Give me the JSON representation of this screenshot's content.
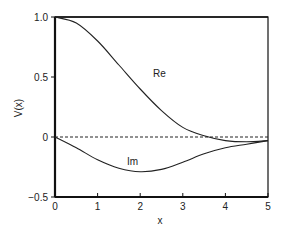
{
  "chart_data": {
    "type": "line",
    "title": "",
    "xlabel": "x",
    "ylabel": "V(x)",
    "xlim": [
      0,
      5
    ],
    "ylim": [
      -0.5,
      1.0
    ],
    "grid": false,
    "legend": "inline labels",
    "x_ticks": [
      "0",
      "1",
      "2",
      "3",
      "4",
      "5"
    ],
    "y_ticks": [
      "-0.5",
      "0",
      "0.5",
      "1.0"
    ],
    "reference_line": {
      "y": 0,
      "style": "dashed"
    },
    "x": [
      0,
      0.5,
      1.0,
      1.5,
      2.0,
      2.5,
      3.0,
      3.5,
      4.0,
      4.5,
      5.0
    ],
    "series": [
      {
        "name": "Re",
        "values": [
          1.0,
          0.95,
          0.8,
          0.6,
          0.4,
          0.22,
          0.08,
          0.01,
          -0.03,
          -0.04,
          -0.03
        ]
      },
      {
        "name": "Im",
        "values": [
          0.0,
          -0.09,
          -0.19,
          -0.26,
          -0.29,
          -0.27,
          -0.21,
          -0.14,
          -0.09,
          -0.06,
          -0.03
        ]
      }
    ],
    "annotations": [
      {
        "text": "Re",
        "x": 2.3,
        "y": 0.53
      },
      {
        "text": "Im",
        "x": 1.7,
        "y": -0.2
      }
    ]
  },
  "labels": {
    "xlabel": "x",
    "ylabel": "V(x)",
    "re": "Re",
    "im": "Im",
    "xt0": "0",
    "xt1": "1",
    "xt2": "2",
    "xt3": "3",
    "xt4": "4",
    "xt5": "5",
    "yt_neg05": "−0.5",
    "yt_0": "0",
    "yt_05": "0.5",
    "yt_10": "1.0"
  }
}
